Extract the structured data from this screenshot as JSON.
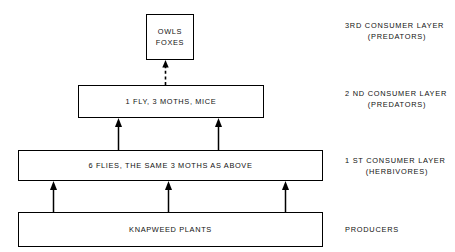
{
  "diagram": {
    "colors": {
      "ink": "#000000",
      "background": "#ffffff"
    },
    "boxes": [
      {
        "id": "predators-top",
        "lines": [
          "OWLS",
          "FOXES"
        ]
      },
      {
        "id": "consumer-2",
        "lines": [
          "1 FLY, 3 MOTHS, MICE"
        ]
      },
      {
        "id": "consumer-1",
        "lines": [
          "6 FLIES, THE SAME 3 MOTHS AS ABOVE"
        ]
      },
      {
        "id": "producers",
        "lines": [
          "KNAPWEED PLANTS"
        ]
      }
    ],
    "captions": [
      {
        "id": "layer-3",
        "line1": "3RD CONSUMER LAYER",
        "line2": "(PREDATORS)"
      },
      {
        "id": "layer-2",
        "line1": "2 ND CONSUMER LAYER",
        "line2": "(PREDATORS)"
      },
      {
        "id": "layer-1",
        "line1": "1 ST CONSUMER LAYER",
        "line2": "(HERBIVORES)"
      },
      {
        "id": "producers",
        "line1": "PRODUCERS",
        "line2": ""
      }
    ],
    "arrows": [
      {
        "id": "dashed-to-top",
        "style": "dashed",
        "direction": "up",
        "from": "consumer-2",
        "to": "predators-top"
      },
      {
        "id": "c1-to-c2-left",
        "style": "solid",
        "direction": "up",
        "from": "consumer-1",
        "to": "consumer-2"
      },
      {
        "id": "c1-to-c2-right",
        "style": "solid",
        "direction": "up",
        "from": "consumer-1",
        "to": "consumer-2"
      },
      {
        "id": "prod-to-c1-a",
        "style": "solid",
        "direction": "up",
        "from": "producers",
        "to": "consumer-1"
      },
      {
        "id": "prod-to-c1-b",
        "style": "solid",
        "direction": "up",
        "from": "producers",
        "to": "consumer-1"
      },
      {
        "id": "prod-to-c1-c",
        "style": "solid",
        "direction": "up",
        "from": "producers",
        "to": "consumer-1"
      }
    ]
  }
}
